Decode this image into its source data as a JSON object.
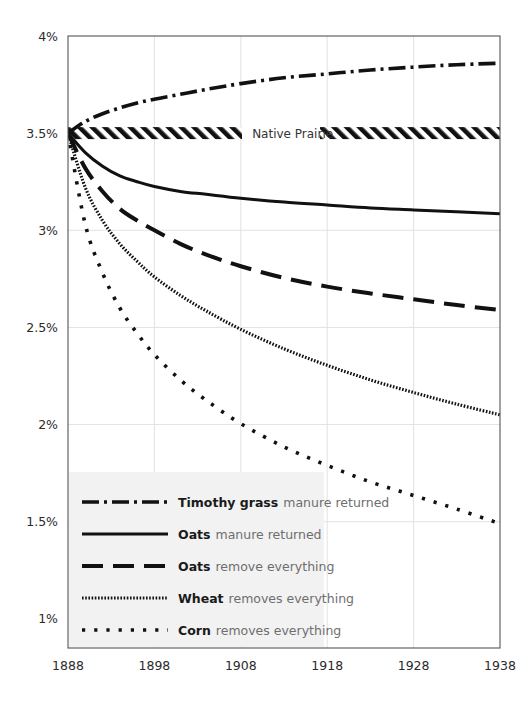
{
  "chart_data": {
    "type": "line",
    "title": "",
    "subtitle": "",
    "xlabel": "",
    "ylabel": "",
    "xlim": [
      1888,
      1938
    ],
    "ylim": [
      0.85,
      4.0
    ],
    "x_ticks": [
      1888,
      1898,
      1908,
      1918,
      1928,
      1938
    ],
    "x_tick_labels": [
      "1888",
      "1898",
      "1908",
      "1918",
      "1928",
      "1938"
    ],
    "y_ticks": [
      4.0,
      3.5,
      3.0,
      2.5,
      2.0,
      1.5,
      1.0
    ],
    "y_tick_labels": [
      "4%",
      "3.5%",
      "3%",
      "2.5%",
      "2%",
      "1.5%",
      "1%"
    ],
    "grid": "both-light",
    "legend_position": "bottom-left",
    "annotations": [
      {
        "text": "Native Prairie",
        "x": 1914,
        "y": 3.5,
        "style": "hatched-band"
      }
    ],
    "x": [
      1888,
      1890,
      1892,
      1894,
      1896,
      1898,
      1901,
      1904,
      1908,
      1913,
      1918,
      1923,
      1928,
      1933,
      1938
    ],
    "series": [
      {
        "name": "Timothy grass",
        "descriptor": "manure returned",
        "dash": "dash-dot",
        "color": "#111111",
        "values": [
          3.5,
          3.56,
          3.6,
          3.63,
          3.655,
          3.675,
          3.7,
          3.725,
          3.755,
          3.785,
          3.805,
          3.825,
          3.84,
          3.852,
          3.86
        ]
      },
      {
        "name": "Native Prairie",
        "descriptor": "hatched reference band",
        "dash": "hatched",
        "color": "#111111",
        "values": [
          3.5,
          3.5,
          3.5,
          3.5,
          3.5,
          3.5,
          3.5,
          3.5,
          3.5,
          3.5,
          3.5,
          3.5,
          3.5,
          3.5,
          3.5
        ]
      },
      {
        "name": "Oats",
        "descriptor": "manure returned",
        "dash": "solid",
        "color": "#111111",
        "values": [
          3.5,
          3.4,
          3.33,
          3.28,
          3.25,
          3.225,
          3.2,
          3.185,
          3.165,
          3.145,
          3.13,
          3.115,
          3.105,
          3.095,
          3.085
        ]
      },
      {
        "name": "Oats",
        "descriptor": "remove everything",
        "dash": "long-dash",
        "color": "#111111",
        "values": [
          3.5,
          3.32,
          3.2,
          3.11,
          3.05,
          3.0,
          2.93,
          2.875,
          2.815,
          2.755,
          2.71,
          2.675,
          2.645,
          2.615,
          2.59
        ]
      },
      {
        "name": "Wheat",
        "descriptor": "removes everything",
        "dash": "fine-dot",
        "color": "#111111",
        "values": [
          3.5,
          3.22,
          3.05,
          2.93,
          2.84,
          2.76,
          2.665,
          2.585,
          2.49,
          2.39,
          2.305,
          2.23,
          2.165,
          2.105,
          2.05
        ]
      },
      {
        "name": "Corn",
        "descriptor": "removes everything",
        "dash": "square-dot",
        "color": "#111111",
        "values": [
          3.5,
          3.03,
          2.78,
          2.6,
          2.47,
          2.36,
          2.23,
          2.125,
          2.005,
          1.885,
          1.79,
          1.705,
          1.635,
          1.565,
          1.49
        ]
      }
    ]
  },
  "legend": {
    "items": [
      {
        "name": "Timothy grass",
        "desc": "manure returned",
        "dash": "dash-dot"
      },
      {
        "name": "Oats",
        "desc": "manure returned",
        "dash": "solid"
      },
      {
        "name": "Oats",
        "desc": "remove everything",
        "dash": "long-dash"
      },
      {
        "name": "Wheat",
        "desc": "removes everything",
        "dash": "fine-dot"
      },
      {
        "name": "Corn",
        "desc": "removes everything",
        "dash": "square-dot"
      }
    ]
  },
  "colors": {
    "line": "#111111",
    "axis": "#555555",
    "grid": "#e2e2e2",
    "legend_bg": "#f2f2f2",
    "tick_text": "#2b2b2b",
    "desc_text": "#6e6e6e"
  }
}
